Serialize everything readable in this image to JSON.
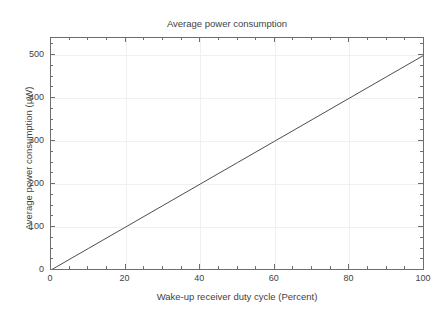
{
  "chart_data": {
    "type": "line",
    "title": "Average power consumption",
    "subtitle": "(example)",
    "xlabel": "Wake-up receiver duty cycle (Percent)",
    "ylabel": "Average power consumption (µW)",
    "xlim": [
      0,
      100
    ],
    "ylim": [
      0,
      540
    ],
    "grid": true,
    "legend": null,
    "xticks": [
      0,
      20,
      40,
      60,
      80,
      100
    ],
    "xticklabels": [
      "0",
      "20",
      "40",
      "60",
      "80",
      "100"
    ],
    "xminor_step": 5,
    "yticks": [
      0,
      100,
      200,
      300,
      400,
      500
    ],
    "yticklabels": [
      "0",
      "100",
      "200",
      "300",
      "400",
      "500"
    ],
    "yminor_step": 25,
    "series": [
      {
        "name": "Average power consumption",
        "color": "#4d4d4d",
        "linewidth": 1,
        "x": [
          0,
          10,
          20,
          30,
          40,
          50,
          60,
          70,
          80,
          90,
          100
        ],
        "values": [
          0,
          50,
          100,
          150,
          200,
          250,
          300,
          350,
          400,
          450,
          500
        ]
      }
    ]
  },
  "style": {
    "background": "#ffffff",
    "frame_color": "#6e6e6e",
    "grid_color": "#f0f0f0",
    "text_color": "#3f3f3f",
    "line_color": "#4d4d4d"
  }
}
